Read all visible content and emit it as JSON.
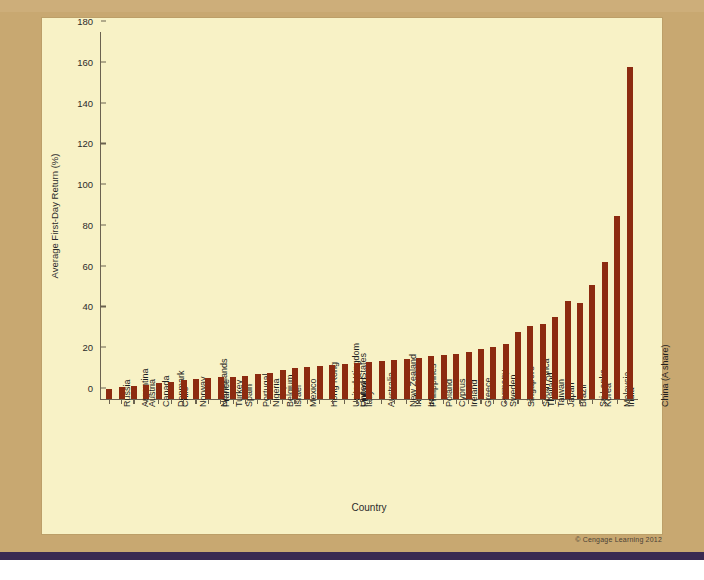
{
  "figure": {
    "copyright": "© Cengage Learning 2012"
  },
  "chart_data": {
    "type": "bar",
    "title": "",
    "xlabel": "Country",
    "ylabel": "Average First-Day Return (%)",
    "ylim": [
      0,
      180
    ],
    "yticks": [
      0,
      20,
      40,
      60,
      80,
      100,
      120,
      140,
      160,
      180
    ],
    "grid": false,
    "legend": "none",
    "bar_color": "#8d2b10",
    "panel_color": "#f8f2c6",
    "page_color": "#c8a871",
    "categories": [
      "Russia",
      "Argentina",
      "Austria",
      "Canada",
      "Denmark",
      "Chile",
      "Norway",
      "Netherlands",
      "France",
      "Turkey",
      "Spain",
      "Portugal",
      "Nigeria",
      "Belgium",
      "Israel",
      "Mexico",
      "Hong Kong",
      "United Kingdom",
      "United States",
      "Finland",
      "Italy",
      "Australia",
      "New Zealand",
      "Indonesia",
      "Philippines",
      "Iran",
      "Poland",
      "Cyprus",
      "Ireland",
      "Greece",
      "Germany",
      "Sweden",
      "Singapore",
      "South Africa",
      "Thailand",
      "Taiwan",
      "Japan",
      "Brazil",
      "Sri Lanka",
      "Korea",
      "Malaysia",
      "India",
      "China (A share)"
    ],
    "values": [
      5,
      6,
      6.5,
      7,
      8,
      8.5,
      9.5,
      10,
      10.5,
      10.8,
      11,
      11.5,
      12.5,
      13,
      14,
      15,
      15.5,
      16,
      16.5,
      17,
      17.5,
      18,
      18.5,
      19,
      19.5,
      20,
      21,
      21.5,
      22,
      23,
      24.5,
      25.5,
      27,
      33,
      36,
      37,
      40,
      48,
      47,
      56,
      67,
      90,
      163
    ]
  }
}
